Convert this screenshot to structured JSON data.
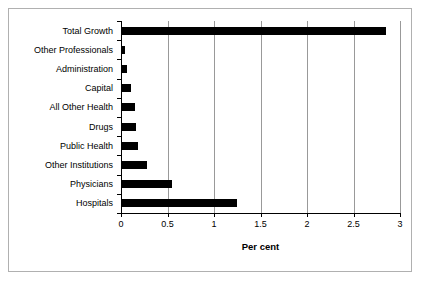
{
  "chart_data": {
    "type": "bar",
    "orientation": "horizontal",
    "title": "",
    "xlabel": "Per cent",
    "ylabel": "",
    "xlim": [
      0,
      3
    ],
    "xticks": [
      "0",
      "0.5",
      "1",
      "1.5",
      "2",
      "2.5",
      "3"
    ],
    "xtick_values": [
      0,
      0.5,
      1,
      1.5,
      2,
      2.5,
      3
    ],
    "grid": true,
    "legend": false,
    "bar_color": "#000000",
    "categories": [
      "Total Growth",
      "Other Professionals",
      "Administration",
      "Capital",
      "All Other Health",
      "Drugs",
      "Public Health",
      "Other Institutions",
      "Physicians",
      "Hospitals"
    ],
    "values": [
      2.85,
      0.04,
      0.06,
      0.11,
      0.15,
      0.16,
      0.18,
      0.28,
      0.55,
      1.25
    ]
  }
}
